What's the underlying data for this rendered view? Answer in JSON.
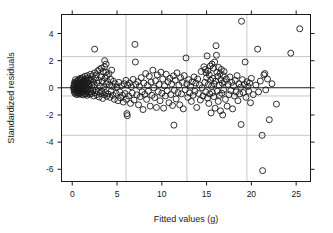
{
  "chart_data": {
    "type": "scatter",
    "title": "",
    "xlabel": "Fitted values (g)",
    "ylabel": "Standardized residuals",
    "xlim": [
      -1.2,
      26.6
    ],
    "ylim": [
      -6.9,
      5.4
    ],
    "xticks": [
      0,
      5,
      10,
      15,
      20,
      25
    ],
    "yticks": [
      4,
      2,
      0,
      -2,
      -4,
      -6
    ],
    "xtick_labels": [
      "0",
      "5",
      "10",
      "15",
      "20",
      "25"
    ],
    "ytick_labels": [
      "4",
      "2",
      "0",
      "-2",
      "-4",
      "-6"
    ],
    "grid": true,
    "grid_color": "#c8c8c8",
    "grid_x": [
      6.0,
      12.8,
      19.5
    ],
    "grid_y": [
      2.3,
      -0.6,
      -3.5
    ],
    "reference_line_y": 0,
    "reference_line_color": "#1a1a1a",
    "marker": "open-circle",
    "marker_color": "#1a1a1a",
    "marker_size": 3.0,
    "legend": null,
    "points": [
      [
        0.15,
        0.05
      ],
      [
        0.18,
        -0.12
      ],
      [
        0.2,
        0.22
      ],
      [
        0.22,
        -0.3
      ],
      [
        0.25,
        0.4
      ],
      [
        0.27,
        -0.05
      ],
      [
        0.3,
        0.15
      ],
      [
        0.31,
        -0.42
      ],
      [
        0.33,
        0.33
      ],
      [
        0.35,
        -0.2
      ],
      [
        0.36,
        0.6
      ],
      [
        0.38,
        0.02
      ],
      [
        0.4,
        -0.35
      ],
      [
        0.42,
        0.28
      ],
      [
        0.44,
        -0.1
      ],
      [
        0.46,
        0.45
      ],
      [
        0.48,
        -0.25
      ],
      [
        0.5,
        0.1
      ],
      [
        0.52,
        -0.5
      ],
      [
        0.55,
        0.35
      ],
      [
        0.57,
        0.0
      ],
      [
        0.6,
        -0.18
      ],
      [
        0.62,
        0.5
      ],
      [
        0.64,
        -0.38
      ],
      [
        0.66,
        0.2
      ],
      [
        0.68,
        -0.08
      ],
      [
        0.7,
        0.62
      ],
      [
        0.72,
        -0.28
      ],
      [
        0.75,
        0.12
      ],
      [
        0.78,
        -0.45
      ],
      [
        0.8,
        0.38
      ],
      [
        0.82,
        -0.15
      ],
      [
        0.85,
        0.55
      ],
      [
        0.88,
        -0.32
      ],
      [
        0.9,
        0.08
      ],
      [
        0.92,
        0.7
      ],
      [
        0.95,
        -0.22
      ],
      [
        0.98,
        0.3
      ],
      [
        1.0,
        -0.48
      ],
      [
        1.02,
        0.18
      ],
      [
        1.05,
        0.65
      ],
      [
        1.08,
        -0.12
      ],
      [
        1.1,
        0.42
      ],
      [
        1.12,
        -0.35
      ],
      [
        1.15,
        0.05
      ],
      [
        1.18,
        0.75
      ],
      [
        1.2,
        -0.25
      ],
      [
        1.22,
        0.25
      ],
      [
        1.25,
        -0.52
      ],
      [
        1.28,
        0.48
      ],
      [
        1.3,
        0.1
      ],
      [
        1.33,
        -0.18
      ],
      [
        1.35,
        0.58
      ],
      [
        1.38,
        -0.4
      ],
      [
        1.4,
        0.3
      ],
      [
        1.42,
        0.85
      ],
      [
        1.45,
        -0.15
      ],
      [
        1.48,
        0.2
      ],
      [
        1.5,
        -0.45
      ],
      [
        1.52,
        0.52
      ],
      [
        1.55,
        0.0
      ],
      [
        1.58,
        0.68
      ],
      [
        1.6,
        -0.3
      ],
      [
        1.62,
        0.35
      ],
      [
        1.65,
        -0.55
      ],
      [
        1.68,
        0.15
      ],
      [
        1.7,
        0.9
      ],
      [
        1.72,
        -0.2
      ],
      [
        1.75,
        0.45
      ],
      [
        1.78,
        -0.38
      ],
      [
        1.8,
        0.25
      ],
      [
        1.85,
        0.72
      ],
      [
        1.88,
        -0.1
      ],
      [
        1.9,
        0.55
      ],
      [
        1.95,
        -0.48
      ],
      [
        2.0,
        0.3
      ],
      [
        2.05,
        1.0
      ],
      [
        2.08,
        -0.28
      ],
      [
        2.1,
        0.6
      ],
      [
        2.15,
        -0.42
      ],
      [
        2.2,
        0.18
      ],
      [
        2.25,
        0.88
      ],
      [
        2.3,
        -0.15
      ],
      [
        2.35,
        0.42
      ],
      [
        2.4,
        -0.6
      ],
      [
        2.45,
        0.22
      ],
      [
        2.5,
        1.1
      ],
      [
        2.5,
        2.85
      ],
      [
        2.55,
        -0.35
      ],
      [
        2.6,
        0.7
      ],
      [
        2.65,
        -0.2
      ],
      [
        2.7,
        0.95
      ],
      [
        2.75,
        -0.5
      ],
      [
        2.8,
        0.35
      ],
      [
        2.85,
        1.25
      ],
      [
        2.9,
        -0.28
      ],
      [
        2.95,
        0.55
      ],
      [
        3.0,
        -0.68
      ],
      [
        3.05,
        1.35
      ],
      [
        3.1,
        0.1
      ],
      [
        3.15,
        -0.42
      ],
      [
        3.2,
        0.8
      ],
      [
        3.25,
        1.45
      ],
      [
        3.3,
        -0.25
      ],
      [
        3.35,
        0.5
      ],
      [
        3.4,
        -0.78
      ],
      [
        3.45,
        1.2
      ],
      [
        3.5,
        0.05
      ],
      [
        3.55,
        -0.5
      ],
      [
        3.6,
        1.55
      ],
      [
        3.62,
        2.0
      ],
      [
        3.65,
        0.72
      ],
      [
        3.7,
        -0.35
      ],
      [
        3.75,
        1.15
      ],
      [
        3.78,
        1.75
      ],
      [
        3.8,
        0.28
      ],
      [
        3.85,
        -0.62
      ],
      [
        3.9,
        0.9
      ],
      [
        3.95,
        0.45
      ],
      [
        4.0,
        -0.45
      ],
      [
        4.1,
        1.05
      ],
      [
        4.15,
        0.2
      ],
      [
        4.2,
        -0.7
      ],
      [
        4.3,
        0.62
      ],
      [
        4.35,
        -0.25
      ],
      [
        4.4,
        1.3
      ],
      [
        4.5,
        0.1
      ],
      [
        4.55,
        -0.55
      ],
      [
        4.6,
        0.48
      ],
      [
        4.7,
        -0.85
      ],
      [
        4.8,
        0.3
      ],
      [
        4.9,
        -0.4
      ],
      [
        5.0,
        0.05
      ],
      [
        5.1,
        -0.95
      ],
      [
        5.2,
        0.4
      ],
      [
        5.3,
        -0.3
      ],
      [
        5.4,
        -0.75
      ],
      [
        5.5,
        0.15
      ],
      [
        5.6,
        -0.55
      ],
      [
        5.7,
        -1.05
      ],
      [
        5.8,
        0.3
      ],
      [
        5.9,
        -0.42
      ],
      [
        6.0,
        0.55
      ],
      [
        6.05,
        -0.85
      ],
      [
        6.1,
        -1.9
      ],
      [
        6.15,
        -2.05
      ],
      [
        6.2,
        0.2
      ],
      [
        6.3,
        -0.6
      ],
      [
        6.4,
        0.35
      ],
      [
        6.5,
        -1.15
      ],
      [
        6.6,
        0.08
      ],
      [
        6.7,
        -0.38
      ],
      [
        6.8,
        0.62
      ],
      [
        6.9,
        -0.9
      ],
      [
        7.0,
        3.2
      ],
      [
        7.05,
        1.9
      ],
      [
        7.1,
        0.25
      ],
      [
        7.2,
        -0.52
      ],
      [
        7.3,
        0.45
      ],
      [
        7.4,
        -1.25
      ],
      [
        7.5,
        0.1
      ],
      [
        7.6,
        -0.65
      ],
      [
        7.7,
        0.75
      ],
      [
        7.8,
        -0.3
      ],
      [
        7.9,
        -1.6
      ],
      [
        8.0,
        0.35
      ],
      [
        8.1,
        -0.48
      ],
      [
        8.2,
        1.05
      ],
      [
        8.3,
        -0.85
      ],
      [
        8.4,
        0.18
      ],
      [
        8.5,
        -0.25
      ],
      [
        8.6,
        0.85
      ],
      [
        8.7,
        -1.35
      ],
      [
        8.8,
        0.42
      ],
      [
        8.9,
        -0.55
      ],
      [
        9.0,
        1.3
      ],
      [
        9.1,
        0.0
      ],
      [
        9.2,
        -0.72
      ],
      [
        9.3,
        0.52
      ],
      [
        9.4,
        -1.45
      ],
      [
        9.5,
        0.95
      ],
      [
        9.6,
        -0.28
      ],
      [
        9.7,
        0.25
      ],
      [
        9.8,
        -0.95
      ],
      [
        9.9,
        1.15
      ],
      [
        10.0,
        -0.4
      ],
      [
        10.1,
        0.65
      ],
      [
        10.2,
        -1.5
      ],
      [
        10.3,
        0.15
      ],
      [
        10.4,
        -0.6
      ],
      [
        10.5,
        1.0
      ],
      [
        10.6,
        -0.22
      ],
      [
        10.7,
        0.45
      ],
      [
        10.8,
        -1.1
      ],
      [
        10.9,
        0.7
      ],
      [
        11.0,
        -0.5
      ],
      [
        11.1,
        0.28
      ],
      [
        11.2,
        -1.3
      ],
      [
        11.3,
        0.88
      ],
      [
        11.35,
        -2.75
      ],
      [
        11.4,
        -0.18
      ],
      [
        11.5,
        0.55
      ],
      [
        11.6,
        -0.82
      ],
      [
        11.7,
        1.1
      ],
      [
        11.8,
        -0.35
      ],
      [
        11.9,
        0.2
      ],
      [
        12.0,
        -1.25
      ],
      [
        12.1,
        0.75
      ],
      [
        12.2,
        -0.45
      ],
      [
        12.3,
        0.4
      ],
      [
        12.4,
        -1.55
      ],
      [
        12.5,
        0.9
      ],
      [
        12.6,
        -0.15
      ],
      [
        12.7,
        2.2
      ],
      [
        12.8,
        0.3
      ],
      [
        12.9,
        -0.7
      ],
      [
        13.0,
        0.6
      ],
      [
        13.1,
        -0.38
      ],
      [
        13.2,
        0.12
      ],
      [
        13.3,
        -1.0
      ],
      [
        13.4,
        0.45
      ],
      [
        13.5,
        -0.55
      ],
      [
        13.6,
        0.8
      ],
      [
        13.7,
        -0.25
      ],
      [
        13.8,
        0.35
      ],
      [
        13.9,
        -1.45
      ],
      [
        14.0,
        0.65
      ],
      [
        14.1,
        -0.42
      ],
      [
        14.2,
        0.22
      ],
      [
        14.3,
        -0.9
      ],
      [
        14.4,
        1.2
      ],
      [
        14.5,
        0.0
      ],
      [
        14.6,
        -0.6
      ],
      [
        14.7,
        1.55
      ],
      [
        14.8,
        0.4
      ],
      [
        14.85,
        1.35
      ],
      [
        14.9,
        -0.3
      ],
      [
        14.95,
        1.1
      ],
      [
        15.0,
        0.75
      ],
      [
        15.05,
        2.35
      ],
      [
        15.1,
        -0.75
      ],
      [
        15.15,
        1.25
      ],
      [
        15.2,
        0.25
      ],
      [
        15.25,
        -1.15
      ],
      [
        15.3,
        0.95
      ],
      [
        15.35,
        -0.45
      ],
      [
        15.4,
        1.6
      ],
      [
        15.45,
        0.55
      ],
      [
        15.5,
        -1.85
      ],
      [
        15.55,
        0.1
      ],
      [
        15.6,
        1.75
      ],
      [
        15.65,
        -0.35
      ],
      [
        15.7,
        0.7
      ],
      [
        15.75,
        1.45
      ],
      [
        15.8,
        -0.65
      ],
      [
        15.85,
        0.3
      ],
      [
        15.9,
        1.9
      ],
      [
        15.95,
        -1.5
      ],
      [
        16.0,
        0.5
      ],
      [
        16.05,
        3.1
      ],
      [
        16.1,
        2.4
      ],
      [
        16.15,
        1.15
      ],
      [
        16.2,
        -0.25
      ],
      [
        16.25,
        0.85
      ],
      [
        16.3,
        -1.0
      ],
      [
        16.35,
        1.5
      ],
      [
        16.4,
        0.2
      ],
      [
        16.45,
        -0.55
      ],
      [
        16.5,
        1.05
      ],
      [
        16.55,
        -1.7
      ],
      [
        16.6,
        0.6
      ],
      [
        16.65,
        1.35
      ],
      [
        16.7,
        -0.4
      ],
      [
        16.75,
        0.35
      ],
      [
        16.8,
        -2.0
      ],
      [
        16.85,
        0.9
      ],
      [
        16.9,
        -0.15
      ],
      [
        16.95,
        1.2
      ],
      [
        17.0,
        0.45
      ],
      [
        17.1,
        -0.85
      ],
      [
        17.2,
        0.65
      ],
      [
        17.3,
        -1.35
      ],
      [
        17.4,
        0.25
      ],
      [
        17.5,
        -0.5
      ],
      [
        17.6,
        0.8
      ],
      [
        17.7,
        -0.2
      ],
      [
        17.8,
        0.4
      ],
      [
        17.9,
        -1.55
      ],
      [
        18.0,
        0.15
      ],
      [
        18.1,
        -0.6
      ],
      [
        18.2,
        0.55
      ],
      [
        18.3,
        -0.3
      ],
      [
        18.4,
        0.9
      ],
      [
        18.5,
        -0.95
      ],
      [
        18.6,
        0.3
      ],
      [
        18.7,
        -0.45
      ],
      [
        18.8,
        0.05
      ],
      [
        18.85,
        -2.7
      ],
      [
        18.9,
        4.9
      ],
      [
        19.0,
        0.6
      ],
      [
        19.1,
        -0.35
      ],
      [
        19.2,
        0.25
      ],
      [
        19.3,
        1.9
      ],
      [
        19.4,
        -0.7
      ],
      [
        19.5,
        0.45
      ],
      [
        19.6,
        0.1
      ],
      [
        19.7,
        -0.25
      ],
      [
        19.8,
        0.35
      ],
      [
        19.9,
        -1.1
      ],
      [
        20.0,
        0.7
      ],
      [
        20.2,
        -0.5
      ],
      [
        20.5,
        0.2
      ],
      [
        20.7,
        2.85
      ],
      [
        20.8,
        -0.3
      ],
      [
        21.0,
        0.5
      ],
      [
        21.2,
        -3.5
      ],
      [
        21.25,
        -6.1
      ],
      [
        21.4,
        0.95
      ],
      [
        21.5,
        1.05
      ],
      [
        21.6,
        -0.15
      ],
      [
        21.8,
        0.65
      ],
      [
        22.0,
        -2.35
      ],
      [
        22.3,
        0.3
      ],
      [
        22.8,
        -1.2
      ],
      [
        24.4,
        2.55
      ],
      [
        25.4,
        4.35
      ]
    ]
  },
  "axis": {
    "x_title": "Fitted values (g)",
    "y_title": "Standardized residuals"
  }
}
